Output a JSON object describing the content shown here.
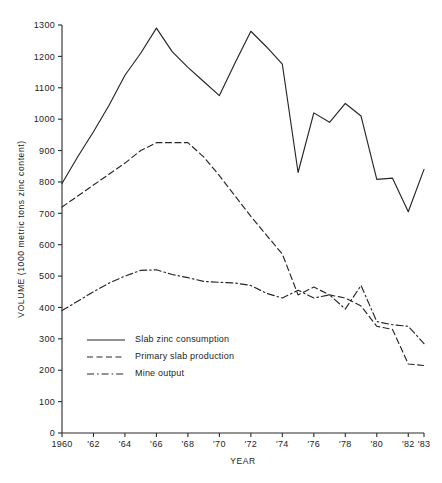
{
  "chart_data": {
    "type": "line",
    "title": "",
    "xlabel": "YEAR",
    "ylabel": "VOLUME (1000 metric tons zinc content)",
    "xlim": [
      1960,
      1983
    ],
    "ylim": [
      0,
      1300
    ],
    "grid": false,
    "legend_position": "inside-lower-left",
    "y_ticks": [
      0,
      100,
      200,
      300,
      400,
      500,
      600,
      700,
      800,
      900,
      1000,
      1100,
      1200,
      1300
    ],
    "y_tick_labels": [
      "0",
      "100",
      "200",
      "300",
      "400",
      "500",
      "600",
      "700",
      "800",
      "900",
      "1000",
      "1100",
      "1200",
      "1300"
    ],
    "x_ticks": [
      1960,
      1962,
      1964,
      1966,
      1968,
      1970,
      1972,
      1974,
      1976,
      1978,
      1980,
      1982,
      1983
    ],
    "x_tick_labels": [
      "1960",
      "'62",
      "'64",
      "'66",
      "'68",
      "'70",
      "'72",
      "'74",
      "'76",
      "'78",
      "'80",
      "'82",
      "'83"
    ],
    "x": [
      1960,
      1961,
      1962,
      1963,
      1964,
      1965,
      1966,
      1967,
      1968,
      1969,
      1970,
      1971,
      1972,
      1973,
      1974,
      1975,
      1976,
      1977,
      1978,
      1979,
      1980,
      1981,
      1982,
      1983
    ],
    "series": [
      {
        "name": "Slab zinc consumption",
        "style": "solid",
        "values": [
          795,
          880,
          960,
          1045,
          1140,
          1210,
          1290,
          1215,
          1165,
          1120,
          1075,
          1180,
          1280,
          1230,
          1175,
          830,
          1020,
          990,
          1050,
          1010,
          808,
          812,
          705,
          840
        ]
      },
      {
        "name": "Primary slab production",
        "style": "dashed",
        "values": [
          720,
          755,
          790,
          825,
          860,
          900,
          925,
          925,
          925,
          880,
          820,
          755,
          690,
          630,
          570,
          440,
          465,
          440,
          430,
          405,
          340,
          330,
          220,
          215
        ]
      },
      {
        "name": "Mine output",
        "style": "dashdot",
        "values": [
          390,
          420,
          450,
          478,
          500,
          518,
          520,
          505,
          495,
          483,
          480,
          478,
          470,
          445,
          430,
          455,
          430,
          440,
          395,
          470,
          355,
          345,
          340,
          285
        ]
      }
    ]
  },
  "legend": {
    "items": [
      {
        "label": "Slab zinc consumption",
        "style": "solid"
      },
      {
        "label": "Primary slab production",
        "style": "dashed"
      },
      {
        "label": "Mine output",
        "style": "dashdot"
      }
    ]
  }
}
